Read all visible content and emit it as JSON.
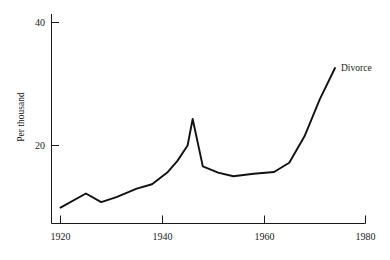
{
  "chart_data": {
    "type": "line",
    "title": "",
    "xlabel": "",
    "ylabel": "Per thousand",
    "xlim": [
      1920,
      1980
    ],
    "ylim": [
      0,
      40
    ],
    "grid": false,
    "legend_position": "inline-end-of-line",
    "xticks": [
      1920,
      1940,
      1960,
      1980
    ],
    "xtick_labels": [
      "1920",
      "1940",
      "1960",
      "1980"
    ],
    "yticks": [
      20,
      40
    ],
    "ytick_labels": [
      "20",
      "40"
    ],
    "series": [
      {
        "name": "Divorce",
        "label_text": "Divorce",
        "color": "#111111",
        "x": [
          1920,
          1925,
          1928,
          1931,
          1935,
          1938,
          1941,
          1943,
          1945,
          1946,
          1948,
          1951,
          1954,
          1958,
          1962,
          1965,
          1968,
          1971,
          1974
        ],
        "values": [
          9.9,
          12.2,
          10.8,
          11.6,
          13.0,
          13.7,
          15.6,
          17.5,
          20.0,
          24.3,
          16.6,
          15.6,
          15.0,
          15.4,
          15.7,
          17.2,
          21.5,
          27.5,
          32.6
        ]
      }
    ]
  },
  "axis": {
    "y_title": "Per thousand"
  }
}
